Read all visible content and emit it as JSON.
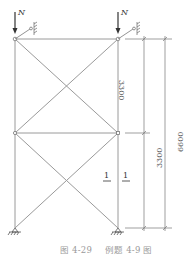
{
  "diagram": {
    "loads": [
      {
        "label": "N"
      },
      {
        "label": "N"
      }
    ],
    "dimensions": {
      "upper_span": "3300",
      "lower_span": "3300",
      "total": "6600"
    },
    "section_marks": [
      "1",
      "1"
    ],
    "colors": {
      "line": "#9a9a9a",
      "text": "#555555",
      "caption": "#9a9a9a"
    }
  },
  "caption": {
    "figure_number": "图 4-29",
    "figure_title": "例题 4-9 图"
  }
}
